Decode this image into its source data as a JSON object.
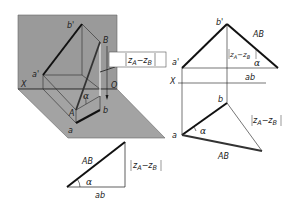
{
  "figure": {
    "colors": {
      "plane_fill": "#9a9a9a",
      "line": "#1a1a1a",
      "background": "#ffffff"
    },
    "pictorial": {
      "labels": {
        "b_prime": "b'",
        "a_prime": "a'",
        "B": "B",
        "A": "A",
        "a": "a",
        "b": "b",
        "X": "X",
        "O": "O",
        "alpha": "α"
      },
      "callout": {
        "z_A": "z",
        "sub_A": "A",
        "minus": "−",
        "z_B": "z",
        "sub_B": "B"
      }
    },
    "triangle": {
      "hypotenuse": "AB",
      "base": "ab",
      "height_z": "z",
      "height_sub_A": "A",
      "height_minus": "−",
      "height_sub_B": "B",
      "alpha": "α"
    },
    "orthographic": {
      "labels": {
        "b_prime": "b'",
        "a_prime": "a'",
        "X": "X",
        "a": "a",
        "b": "b",
        "AB_front": "AB",
        "ab_front": "ab",
        "alpha_front": "α",
        "AB_top": "AB",
        "alpha_top": "α"
      },
      "front_diff": {
        "z": "z",
        "sub_A": "A",
        "minus": "−",
        "sub_B": "B"
      },
      "top_diff": {
        "z": "z",
        "sub_A": "A",
        "minus": "−",
        "sub_B": "B"
      }
    }
  }
}
